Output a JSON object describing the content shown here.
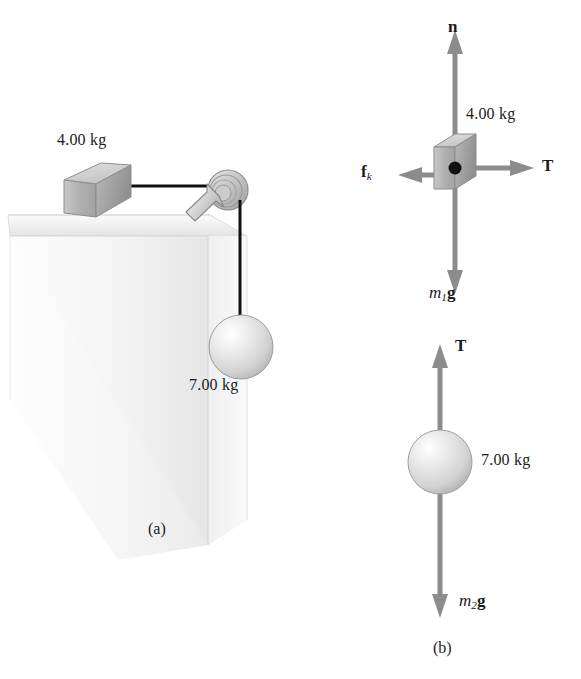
{
  "figure": {
    "panels": [
      {
        "id": "a",
        "label": "(a)",
        "caption": "Pictorial representation"
      },
      {
        "id": "b",
        "label": "(b)",
        "caption": "Free-body diagrams"
      }
    ]
  },
  "panel_a": {
    "label": "(a)",
    "block_mass_label": "4.00 kg",
    "sphere_mass_label": "7.00 kg",
    "parts": {
      "block": "block",
      "table": "table-corner",
      "pulley": "pulley",
      "string_horizontal": "string-horizontal",
      "string_vertical": "string-vertical",
      "sphere": "sphere"
    }
  },
  "panel_b": {
    "label": "(b)",
    "block_diagram": {
      "mass_label": "4.00 kg",
      "forces": [
        {
          "name": "normal-force",
          "symbol": "n",
          "symbol_sub": "",
          "direction": "up"
        },
        {
          "name": "tension-force",
          "symbol": "T",
          "symbol_sub": "",
          "direction": "right"
        },
        {
          "name": "kinetic-friction-force",
          "symbol": "f",
          "symbol_sub": "k",
          "direction": "left"
        },
        {
          "name": "weight-force",
          "symbol": "m",
          "symbol_sub": "1",
          "symbol_tail": "g",
          "direction": "down"
        }
      ]
    },
    "sphere_diagram": {
      "mass_label": "7.00 kg",
      "forces": [
        {
          "name": "tension-force",
          "symbol": "T",
          "symbol_sub": "",
          "direction": "up"
        },
        {
          "name": "weight-force",
          "symbol": "m",
          "symbol_sub": "2",
          "symbol_tail": "g",
          "direction": "down"
        }
      ]
    }
  },
  "labels": {
    "n": "n",
    "T": "T",
    "f": "f",
    "f_sub": "k",
    "m1": "m",
    "m1_sub": "1",
    "g": "g",
    "m2": "m",
    "m2_sub": "2",
    "mass_4": "4.00 kg",
    "mass_7": "7.00 kg",
    "panel_a": "(a)",
    "panel_b": "(b)"
  },
  "colors": {
    "arrow_gray": "#8c8c8c",
    "block_face": "#b4b4b4",
    "block_top": "#d6d6d6",
    "block_side": "#9a9a9a",
    "table_top": "#ececec",
    "table_face": "#f2f2f2",
    "string_black": "#111111",
    "pulley_gray": "#c9c9c9",
    "sphere_light": "#ffffff",
    "sphere_mid": "#d8d8d8",
    "sphere_edge": "#a8a8a8",
    "text": "#1b1b1b"
  }
}
